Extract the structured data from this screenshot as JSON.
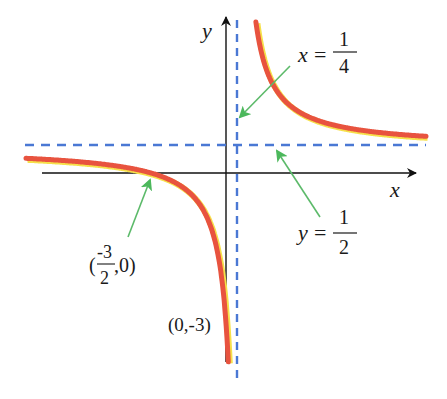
{
  "chart_data": {
    "type": "line",
    "title": "",
    "function": "f(x) = (2x+3)/(4x-1)",
    "xlabel": "x",
    "ylabel": "y",
    "asymptotes": {
      "vertical": {
        "x": 0.25,
        "label_lhs": "x",
        "label_num": "1",
        "label_den": "4"
      },
      "horizontal": {
        "y": 0.5,
        "label_lhs": "y",
        "label_num": "1",
        "label_den": "2"
      }
    },
    "points": [
      {
        "name": "x-intercept",
        "x": -1.5,
        "y": 0,
        "label_open": "(",
        "label_num": "-3",
        "label_den": "2",
        "label_close": ",0)"
      },
      {
        "name": "y-intercept",
        "x": 0,
        "y": -3,
        "label": "(0,-3)"
      }
    ],
    "series": [
      {
        "name": "left-branch",
        "x_range": [
          -4.0,
          0.1
        ]
      },
      {
        "name": "right-branch",
        "x_range": [
          0.38,
          4.0
        ]
      }
    ],
    "grid": false,
    "colors": {
      "curve": "#e8533f",
      "curve_glow": "#f6e04a",
      "asymptote": "#4a78d4",
      "pointer_arrow": "#5cba6a",
      "axis": "#111111"
    }
  },
  "labels": {
    "x_axis": "x",
    "y_axis": "y",
    "equals": "="
  }
}
